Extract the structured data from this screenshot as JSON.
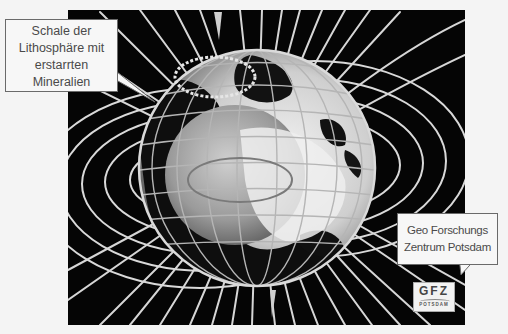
{
  "figure": {
    "palette": {
      "background": "#050505",
      "field_lines": "#d9d9d9",
      "globe_light": "#e8e8e8",
      "globe_mid": "#9a9a9a",
      "continents": "#0d0d0d",
      "page": "#f4f4f4"
    }
  },
  "callouts": {
    "left": {
      "lines": [
        "Schale der",
        "Lithosphäre mit",
        "erstarrten",
        "Mineralien"
      ]
    },
    "right": {
      "lines": [
        "Geo Forschungs",
        "Zentrum Potsdam"
      ]
    }
  },
  "logo": {
    "main": "GFZ",
    "sub": "POTSDAM"
  }
}
